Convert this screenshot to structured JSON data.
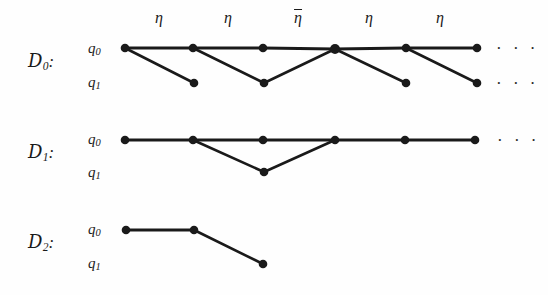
{
  "figure": {
    "background_color": "#fefefe",
    "ink_color": "#1a1a1a",
    "width": 548,
    "height": 295
  },
  "rows": [
    {
      "name": "D0",
      "label_main": "D",
      "label_sub": "0",
      "label_colon": ":",
      "label_x": 28,
      "label_y": 62,
      "state_top": {
        "main": "q",
        "sub": "0",
        "x": 88,
        "y": 55
      },
      "state_bottom": {
        "main": "q",
        "sub": "1",
        "x": 88,
        "y": 89
      },
      "top_y": 48,
      "bottom_y": 83,
      "top_nodes_x": [
        125,
        193,
        263,
        335,
        406,
        477
      ],
      "bottom_nodes_x": [
        194,
        264,
        406,
        477
      ],
      "edges": [
        {
          "from": [
            125,
            48
          ],
          "to": [
            193,
            48
          ],
          "kind": "horizontal"
        },
        {
          "from": [
            193,
            48
          ],
          "to": [
            263,
            48
          ],
          "kind": "horizontal"
        },
        {
          "from": [
            263,
            48
          ],
          "to": [
            335,
            49
          ],
          "kind": "horizontal"
        },
        {
          "from": [
            335,
            49
          ],
          "to": [
            406,
            48
          ],
          "kind": "horizontal"
        },
        {
          "from": [
            406,
            48
          ],
          "to": [
            477,
            48
          ],
          "kind": "horizontal"
        },
        {
          "from": [
            125,
            48
          ],
          "to": [
            194,
            83
          ],
          "kind": "diagonal"
        },
        {
          "from": [
            193,
            48
          ],
          "to": [
            264,
            83
          ],
          "kind": "diagonal"
        },
        {
          "from": [
            264,
            83
          ],
          "to": [
            335,
            49
          ],
          "kind": "diagonal"
        },
        {
          "from": [
            335,
            49
          ],
          "to": [
            406,
            83
          ],
          "kind": "diagonal"
        },
        {
          "from": [
            406,
            48
          ],
          "to": [
            477,
            83
          ],
          "kind": "diagonal"
        }
      ],
      "ellipsis_top": {
        "text": "· · ·",
        "x": 496,
        "y": 48
      },
      "ellipsis_bottom": {
        "text": "· · ·",
        "x": 496,
        "y": 83
      },
      "edge_labels": [
        {
          "text": "η",
          "overline": false,
          "x": 159,
          "y": 10
        },
        {
          "text": "η",
          "overline": false,
          "x": 228,
          "y": 10
        },
        {
          "text": "η",
          "overline": true,
          "x": 298,
          "y": 10
        },
        {
          "text": "η",
          "overline": false,
          "x": 369,
          "y": 10
        },
        {
          "text": "η",
          "overline": false,
          "x": 440,
          "y": 10
        }
      ]
    },
    {
      "name": "D1",
      "label_main": "D",
      "label_sub": "1",
      "label_colon": ":",
      "label_x": 28,
      "label_y": 153,
      "state_top": {
        "main": "q",
        "sub": "0",
        "x": 88,
        "y": 146
      },
      "state_bottom": {
        "main": "q",
        "sub": "1",
        "x": 88,
        "y": 179
      },
      "top_y": 140,
      "bottom_y": 172,
      "top_nodes_x": [
        125,
        193,
        263,
        335,
        405,
        475
      ],
      "bottom_nodes_x": [
        264
      ],
      "edges": [
        {
          "from": [
            125,
            140
          ],
          "to": [
            193,
            140
          ],
          "kind": "horizontal"
        },
        {
          "from": [
            193,
            140
          ],
          "to": [
            263,
            140
          ],
          "kind": "horizontal"
        },
        {
          "from": [
            263,
            140
          ],
          "to": [
            335,
            140
          ],
          "kind": "horizontal"
        },
        {
          "from": [
            335,
            140
          ],
          "to": [
            405,
            140
          ],
          "kind": "horizontal"
        },
        {
          "from": [
            405,
            140
          ],
          "to": [
            475,
            140
          ],
          "kind": "horizontal"
        },
        {
          "from": [
            193,
            140
          ],
          "to": [
            264,
            172
          ],
          "kind": "diagonal"
        },
        {
          "from": [
            264,
            172
          ],
          "to": [
            335,
            140
          ],
          "kind": "diagonal"
        }
      ],
      "ellipsis_top": {
        "text": "· · ·",
        "x": 497,
        "y": 140
      },
      "ellipsis_bottom": null,
      "edge_labels": []
    },
    {
      "name": "D2",
      "label_main": "D",
      "label_sub": "2",
      "label_colon": ":",
      "label_x": 28,
      "label_y": 243,
      "state_top": {
        "main": "q",
        "sub": "0",
        "x": 88,
        "y": 236
      },
      "state_bottom": {
        "main": "q",
        "sub": "1",
        "x": 88,
        "y": 270
      },
      "top_y": 230,
      "bottom_y": 264,
      "top_nodes_x": [
        126,
        194
      ],
      "bottom_nodes_x": [
        263
      ],
      "edges": [
        {
          "from": [
            126,
            230
          ],
          "to": [
            194,
            230
          ],
          "kind": "horizontal"
        },
        {
          "from": [
            194,
            230
          ],
          "to": [
            263,
            264
          ],
          "kind": "diagonal"
        }
      ],
      "ellipsis_top": null,
      "ellipsis_bottom": null,
      "edge_labels": []
    }
  ],
  "style": {
    "node_radius": 4.3,
    "node_radius_large": 5.0,
    "edge_width_horizontal": 3.0,
    "edge_width_diagonal": 2.6
  }
}
